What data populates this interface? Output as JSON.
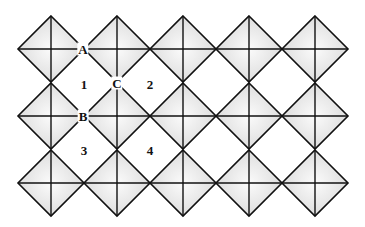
{
  "diagram": {
    "type": "octahedral-tiling",
    "grid": {
      "columns": 5,
      "rows": 3,
      "origin_x": 51,
      "origin_y": 49,
      "spacing_x": 66,
      "spacing_y": 67,
      "half_size": 33
    },
    "colors": {
      "stroke": "#111111",
      "fill_center": "#f7f7f7",
      "fill_edge": "#d6d6d6",
      "background": "#ffffff"
    },
    "point_labels": [
      {
        "text": "A",
        "x": 83,
        "y": 49
      },
      {
        "text": "B",
        "x": 83,
        "y": 116
      },
      {
        "text": "C",
        "x": 117,
        "y": 83
      }
    ],
    "region_labels": [
      {
        "text": "1",
        "x": 84,
        "y": 84
      },
      {
        "text": "2",
        "x": 150,
        "y": 84
      },
      {
        "text": "3",
        "x": 84,
        "y": 150
      },
      {
        "text": "4",
        "x": 150,
        "y": 150
      }
    ]
  }
}
